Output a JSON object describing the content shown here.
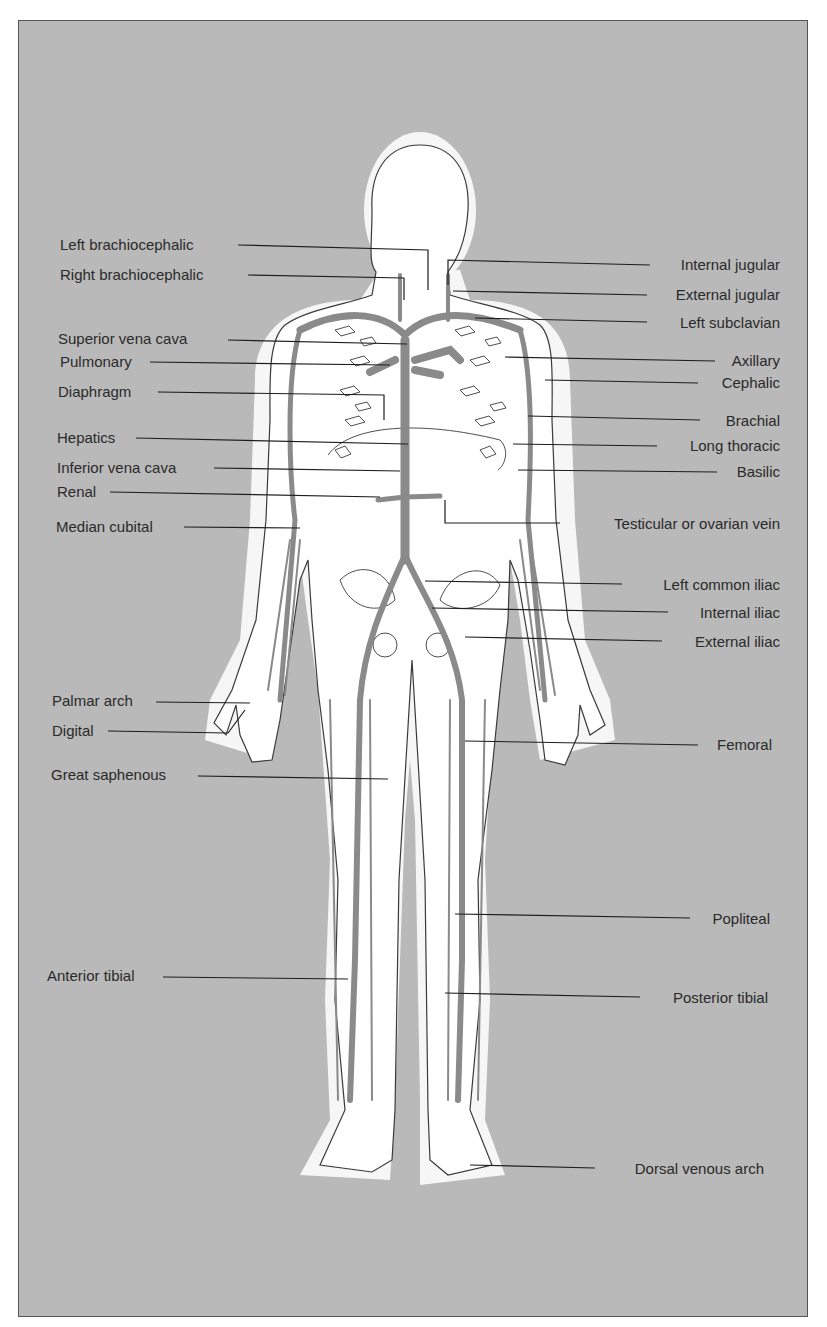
{
  "diagram": {
    "title": "",
    "colors": {
      "background": "#b9b9b9",
      "body_fill": "#ffffff",
      "halo": "#f4f4f4",
      "vein": "#8a8a8a",
      "outline": "#3a3a3a",
      "leader": "#1e1e1e",
      "text": "#2a2a2a"
    },
    "labels_left": [
      {
        "text": "Left brachiocephalic",
        "x": 60,
        "y": 235,
        "target": [
          428,
          250
        ]
      },
      {
        "text": "Right brachiocephalic",
        "x": 60,
        "y": 265,
        "target": [
          404,
          278
        ]
      },
      {
        "text": "Superior vena cava",
        "x": 58,
        "y": 328,
        "target": [
          407,
          344
        ]
      },
      {
        "text": "Pulmonary",
        "x": 60,
        "y": 352,
        "target": [
          390,
          365
        ]
      },
      {
        "text": "Diaphragm",
        "x": 58,
        "y": 382,
        "target": [
          387,
          395
        ]
      },
      {
        "text": "Hepatics",
        "x": 57,
        "y": 428,
        "target": [
          408,
          444
        ]
      },
      {
        "text": "Inferior vena cava",
        "x": 57,
        "y": 458,
        "target": [
          400,
          471
        ]
      },
      {
        "text": "Renal",
        "x": 57,
        "y": 482,
        "target": [
          380,
          497
        ]
      },
      {
        "text": "Median cubital",
        "x": 56,
        "y": 517,
        "target": [
          300,
          528
        ]
      },
      {
        "text": "Palmar arch",
        "x": 52,
        "y": 691,
        "target": [
          250,
          703
        ]
      },
      {
        "text": "Digital",
        "x": 52,
        "y": 720,
        "target": [
          245,
          708
        ]
      },
      {
        "text": "Great saphenous",
        "x": 51,
        "y": 764,
        "target": [
          388,
          779
        ]
      },
      {
        "text": "Anterior tibial",
        "x": 47,
        "y": 965,
        "target": [
          348,
          979
        ]
      }
    ],
    "labels_right": [
      {
        "text": "Internal jugular",
        "right": 780,
        "y": 256,
        "target": [
          448,
          260
        ]
      },
      {
        "text": "External jugular",
        "right": 780,
        "y": 286,
        "target": [
          453,
          291
        ]
      },
      {
        "text": "Left subclavian",
        "right": 780,
        "y": 315,
        "target": [
          475,
          318
        ]
      },
      {
        "text": "Axillary",
        "right": 780,
        "y": 351,
        "target": [
          505,
          357
        ]
      },
      {
        "text": "Cephalic",
        "right": 780,
        "y": 374,
        "target": [
          545,
          380
        ]
      },
      {
        "text": "Brachial",
        "right": 780,
        "y": 412,
        "target": [
          528,
          416
        ]
      },
      {
        "text": "Long thoracic",
        "right": 780,
        "y": 437,
        "target": [
          513,
          444
        ]
      },
      {
        "text": "Basilic",
        "right": 780,
        "y": 462,
        "target": [
          518,
          470
        ]
      },
      {
        "text": "Testicular or ovarian vein",
        "right": 780,
        "y": 516,
        "target": [
          445,
          500
        ]
      },
      {
        "text": "Left common iliac",
        "right": 780,
        "y": 577,
        "target": [
          425,
          581
        ]
      },
      {
        "text": "Internal iliac",
        "right": 780,
        "y": 605,
        "target": [
          432,
          608
        ]
      },
      {
        "text": "External iliac",
        "right": 780,
        "y": 634,
        "target": [
          465,
          637
        ]
      },
      {
        "text": "Femoral",
        "right": 780,
        "y": 737,
        "target": [
          465,
          741
        ]
      },
      {
        "text": "Popliteal",
        "right": 780,
        "y": 911,
        "target": [
          455,
          914
        ]
      },
      {
        "text": "Posterior tibial",
        "right": 780,
        "y": 989,
        "target": [
          445,
          993
        ]
      },
      {
        "text": "Dorsal venous arch",
        "right": 780,
        "y": 1160,
        "target": [
          470,
          1165
        ]
      }
    ]
  }
}
